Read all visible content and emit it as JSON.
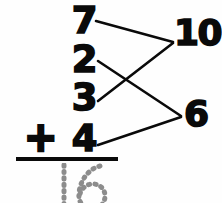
{
  "worksheet": {
    "kind": "column-addition-make-ten",
    "background_color": "#fefefe",
    "ink_color": "#0a0a0a",
    "trace_color": "#8c8c8c",
    "problem_text": "7 + 2 + 3 + 4",
    "operator": "+",
    "addends": [
      {
        "value": "7",
        "row": 1
      },
      {
        "value": "2",
        "row": 2
      },
      {
        "value": "3",
        "row": 3
      },
      {
        "value": "4",
        "row": 4
      }
    ],
    "pair_sums": [
      {
        "value": "10",
        "pairs": "7+3"
      },
      {
        "value": "6",
        "pairs": "2+4"
      }
    ],
    "answer": {
      "value": "16",
      "style": "dotted-trace",
      "digits": [
        "1",
        "6"
      ]
    },
    "connectors": [
      {
        "from": "7",
        "to": "10"
      },
      {
        "from": "3",
        "to": "10"
      },
      {
        "from": "2",
        "to": "6"
      },
      {
        "from": "4",
        "to": "6"
      }
    ]
  }
}
